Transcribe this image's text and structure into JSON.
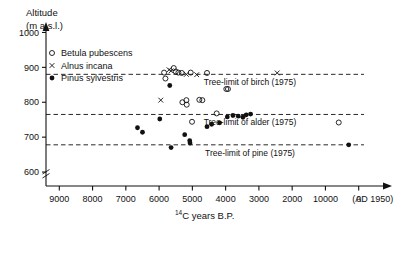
{
  "chart_data": {
    "type": "scatter",
    "title": "",
    "ylabel_line1": "Altitude",
    "ylabel_line2": "(m a.s.l.)",
    "xlabel_pre": "14",
    "xlabel_main": "C years B.P.",
    "yticks": [
      600,
      700,
      800,
      900,
      1000
    ],
    "ylim": [
      560,
      1030
    ],
    "xticks": [
      {
        "value": 9000,
        "label": "9000"
      },
      {
        "value": 8000,
        "label": "8000"
      },
      {
        "value": 7000,
        "label": "7000"
      },
      {
        "value": 6000,
        "label": "6000"
      },
      {
        "value": 5000,
        "label": "5000"
      },
      {
        "value": 4000,
        "label": "4000"
      },
      {
        "value": 3000,
        "label": "3000"
      },
      {
        "value": 2000,
        "label": "2000"
      },
      {
        "value": 1000,
        "label": "10000"
      },
      {
        "value": 0,
        "label": "0"
      }
    ],
    "xaxis_end_label": "(AD 1950)",
    "xlim": [
      9400,
      -400
    ],
    "grid": false,
    "axis_break": true,
    "legend_position": "top-left",
    "legend": [
      {
        "marker": "open-circle",
        "label": "Betula pubescens"
      },
      {
        "marker": "cross",
        "label": "Alnus incana"
      },
      {
        "marker": "filled-circle",
        "label": "Pinus sylvestris"
      }
    ],
    "reference_lines": [
      {
        "name": "birch",
        "label": "Tree-limit of birch (1975)",
        "y": 880
      },
      {
        "name": "alder",
        "label": "Tree-limit of alder (1975)",
        "y": 765
      },
      {
        "name": "pine",
        "label": "Tree-limit of pine (1975)",
        "y": 678
      }
    ],
    "series": [
      {
        "name": "Betula pubescens",
        "marker": "open-circle",
        "points": [
          [
            5850,
            885
          ],
          [
            5810,
            868
          ],
          [
            5560,
            898
          ],
          [
            5500,
            888
          ],
          [
            5420,
            885
          ],
          [
            5320,
            884
          ],
          [
            5050,
            885
          ],
          [
            4560,
            884
          ],
          [
            4790,
            807
          ],
          [
            4700,
            806
          ],
          [
            3980,
            838
          ],
          [
            3930,
            838
          ],
          [
            5300,
            800
          ],
          [
            5180,
            806
          ],
          [
            5170,
            793
          ],
          [
            4270,
            768
          ],
          [
            5010,
            744
          ],
          [
            600,
            742
          ]
        ]
      },
      {
        "name": "Alnus incana",
        "marker": "cross",
        "points": [
          [
            5700,
            893
          ],
          [
            5640,
            890
          ],
          [
            5180,
            880
          ],
          [
            4870,
            879
          ],
          [
            5950,
            806
          ],
          [
            2450,
            884
          ]
        ]
      },
      {
        "name": "Pinus sylvestris",
        "marker": "filled-circle",
        "points": [
          [
            5680,
            848
          ],
          [
            6650,
            727
          ],
          [
            6500,
            714
          ],
          [
            5980,
            752
          ],
          [
            5230,
            707
          ],
          [
            5080,
            690
          ],
          [
            5070,
            683
          ],
          [
            5640,
            670
          ],
          [
            4560,
            730
          ],
          [
            4420,
            737
          ],
          [
            4180,
            741
          ],
          [
            3950,
            758
          ],
          [
            3780,
            762
          ],
          [
            3620,
            760
          ],
          [
            3480,
            757
          ],
          [
            3380,
            764
          ],
          [
            3250,
            766
          ],
          [
            300,
            678
          ]
        ]
      }
    ]
  }
}
